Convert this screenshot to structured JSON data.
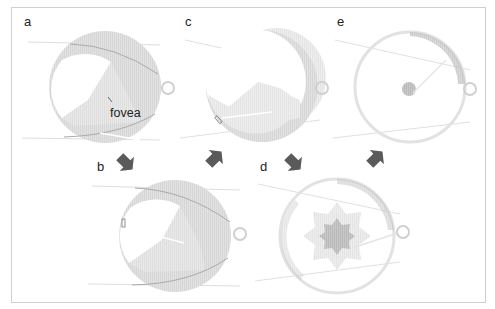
{
  "figure": {
    "panels": [
      {
        "id": "a",
        "label": "a",
        "x": 24,
        "y": 14
      },
      {
        "id": "b",
        "label": "b",
        "x": 96,
        "y": 160
      },
      {
        "id": "c",
        "label": "c",
        "x": 185,
        "y": 14
      },
      {
        "id": "d",
        "label": "d",
        "x": 259,
        "y": 160
      },
      {
        "id": "e",
        "label": "e",
        "x": 336,
        "y": 14
      }
    ],
    "annotations": {
      "fovea": "fovea"
    },
    "sequence": [
      "a",
      "b",
      "c",
      "d",
      "e"
    ],
    "colors": {
      "retina_fill": "#dcdcdc",
      "retina_ring": "#d2d2d2",
      "vessel": "#b8b8b8",
      "arrow": "#5a5a5a",
      "frame": "#cfcfcf",
      "scotoma_core": "#bdbdbd",
      "scotoma_halo": "#ececec"
    }
  }
}
